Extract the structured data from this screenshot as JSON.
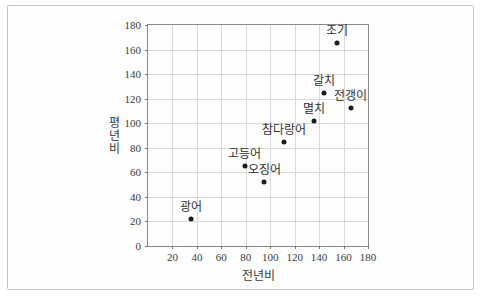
{
  "figure": {
    "background": "#ffffff",
    "frame_border_color": "#c5c5c5",
    "plot_border_color": "#8a8a8a"
  },
  "chart_data": {
    "type": "scatter",
    "title": "",
    "xlabel": "전년비",
    "ylabel": "평년비",
    "xlim": [
      0,
      180
    ],
    "ylim": [
      0,
      180
    ],
    "x_ticks": [
      20,
      40,
      60,
      80,
      100,
      120,
      140,
      160,
      180
    ],
    "y_ticks": [
      0,
      20,
      40,
      60,
      80,
      100,
      120,
      140,
      160,
      180
    ],
    "grid": true,
    "legend": "none",
    "points": [
      {
        "label": "광어",
        "x": 35,
        "y": 22
      },
      {
        "label": "고등어",
        "x": 79,
        "y": 65
      },
      {
        "label": "오징어",
        "x": 95,
        "y": 52
      },
      {
        "label": "참다랑어",
        "x": 111,
        "y": 85
      },
      {
        "label": "멸치",
        "x": 136,
        "y": 102
      },
      {
        "label": "갈치",
        "x": 144,
        "y": 125
      },
      {
        "label": "전갱이",
        "x": 166,
        "y": 112
      },
      {
        "label": "조기",
        "x": 155,
        "y": 165
      }
    ],
    "colors": {
      "dot": "#1c1c1c",
      "grid": "#d9d9d9",
      "axis": "#8a8a8a",
      "text": "#3a3a3a"
    }
  }
}
